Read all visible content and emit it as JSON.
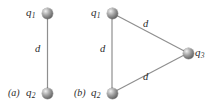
{
  "figure": {
    "type": "physics-charge-configuration-diagram",
    "background_color": "#ffffff",
    "line_color": "#8f8f8f",
    "text_color": "#2b2b2b",
    "sphere_color": "#7d7d7d"
  },
  "panels": [
    {
      "id": "a",
      "caption": "(a)",
      "caption_letter": "a",
      "shape": "line-segment",
      "charges": [
        {
          "id": "q1",
          "symbol": "q",
          "subscript": "1",
          "label": "q1",
          "position": "top"
        },
        {
          "id": "q2",
          "symbol": "q",
          "subscript": "2",
          "label": "q2",
          "position": "bottom"
        }
      ],
      "distances": [
        {
          "id": "d-a-vertical",
          "label": "d",
          "between": "q1-q2"
        }
      ]
    },
    {
      "id": "b",
      "caption": "(b)",
      "caption_letter": "b",
      "shape": "triangle",
      "charges": [
        {
          "id": "q1",
          "symbol": "q",
          "subscript": "1",
          "label": "q1",
          "position": "top-left"
        },
        {
          "id": "q2",
          "symbol": "q",
          "subscript": "2",
          "label": "q2",
          "position": "bottom-left"
        },
        {
          "id": "q3",
          "symbol": "q",
          "subscript": "3",
          "label": "q3",
          "position": "right"
        }
      ],
      "distances": [
        {
          "id": "d-b-left",
          "label": "d",
          "between": "q1-q2"
        },
        {
          "id": "d-b-upper",
          "label": "d",
          "between": "q1-q3"
        },
        {
          "id": "d-b-lower",
          "label": "d",
          "between": "q2-q3"
        }
      ]
    }
  ]
}
